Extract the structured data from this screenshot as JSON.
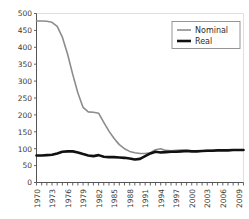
{
  "chart_data": {
    "type": "line",
    "title": "",
    "xlabel": "",
    "ylabel": "",
    "xlim": [
      1970,
      2010
    ],
    "ylim": [
      0,
      500
    ],
    "grid": false,
    "legend_position": "top-right",
    "y_ticks": [
      0,
      50,
      100,
      150,
      200,
      250,
      300,
      350,
      400,
      450,
      500
    ],
    "x_ticks": [
      1970,
      1973,
      1976,
      1979,
      1982,
      1985,
      1988,
      1991,
      1994,
      1997,
      2000,
      2003,
      2006,
      2009
    ],
    "x_minor_ticks_every": 1,
    "x": [
      1970,
      1971,
      1972,
      1973,
      1974,
      1975,
      1976,
      1977,
      1978,
      1979,
      1980,
      1981,
      1982,
      1983,
      1984,
      1985,
      1986,
      1987,
      1988,
      1989,
      1990,
      1991,
      1992,
      1993,
      1994,
      1995,
      1996,
      1997,
      1998,
      1999,
      2000,
      2001,
      2002,
      2003,
      2004,
      2005,
      2006,
      2007,
      2008,
      2009,
      2010
    ],
    "series": [
      {
        "name": "Nominal",
        "color": "#8c8c8c",
        "width": 1.6,
        "values": [
          478,
          478,
          477,
          474,
          462,
          430,
          380,
          320,
          265,
          222,
          209,
          208,
          205,
          178,
          152,
          130,
          112,
          100,
          92,
          88,
          86,
          86,
          88,
          97,
          100,
          95,
          94,
          95,
          96,
          96,
          94,
          93,
          94,
          95,
          95,
          96,
          96,
          96,
          97,
          97,
          97
        ]
      },
      {
        "name": "Real",
        "color": "#111111",
        "width": 2.6,
        "values": [
          80,
          80,
          81,
          82,
          86,
          91,
          92,
          92,
          89,
          84,
          80,
          78,
          81,
          76,
          75,
          75,
          74,
          73,
          71,
          68,
          70,
          78,
          86,
          91,
          89,
          90,
          91,
          91,
          92,
          93,
          92,
          92,
          93,
          94,
          94,
          95,
          95,
          95,
          96,
          96,
          96
        ]
      }
    ]
  },
  "legend": {
    "items": [
      {
        "label": "Nominal",
        "color": "#8c8c8c"
      },
      {
        "label": "Real",
        "color": "#111111"
      }
    ]
  },
  "axis": {
    "y_tick_labels": [
      "500",
      "450",
      "400",
      "350",
      "300",
      "250",
      "200",
      "150",
      "100",
      "50",
      "0"
    ],
    "x_tick_labels": [
      "1970",
      "1973",
      "1976",
      "1979",
      "1982",
      "1985",
      "1988",
      "1991",
      "1994",
      "1997",
      "2000",
      "2003",
      "2006",
      "2009"
    ]
  }
}
